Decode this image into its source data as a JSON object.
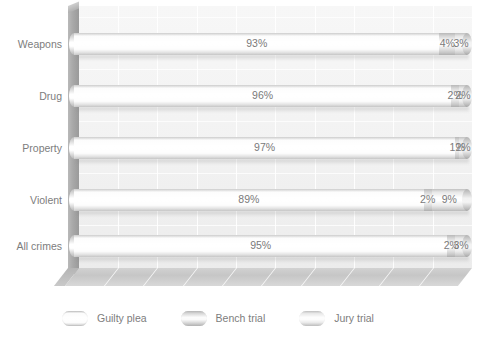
{
  "chart_data": {
    "type": "bar",
    "orientation": "horizontal",
    "stacked": true,
    "title": "",
    "subtitle": "",
    "xlabel": "",
    "ylabel": "",
    "xlim": [
      0,
      100
    ],
    "grid": true,
    "legend_position": "bottom",
    "categories": [
      "Weapons",
      "Drug",
      "Property",
      "Violent",
      "All crimes"
    ],
    "series": [
      {
        "name": "Guilty plea",
        "color": "#fcfcfc",
        "values": [
          93,
          96,
          97,
          89,
          95
        ],
        "labels": [
          "93%",
          "96%",
          "97%",
          "89%",
          "95%"
        ]
      },
      {
        "name": "Bench trial",
        "color": "#cfcfcf",
        "values": [
          4,
          2,
          1,
          2,
          2
        ],
        "labels": [
          "4%",
          "2%",
          "1%",
          "2%",
          "2%"
        ]
      },
      {
        "name": "Jury trial",
        "color": "#e3e3e3",
        "values": [
          3,
          2,
          2,
          9,
          3
        ],
        "labels": [
          "3%",
          "2%",
          "2%",
          "9%",
          "3%"
        ]
      }
    ]
  },
  "axis": {
    "category_labels": [
      "Weapons",
      "Drug",
      "Property",
      "Violent",
      "All crimes"
    ]
  },
  "legend": {
    "items": [
      {
        "label": "Guilty plea",
        "swatch": "guilty-plea-swatch"
      },
      {
        "label": "Bench trial",
        "swatch": "bench-trial-swatch"
      },
      {
        "label": "Jury trial",
        "swatch": "jury-trial-swatch"
      }
    ]
  },
  "colors": {
    "guilty_plea": "#fcfcfc",
    "bench_trial": "#cfcfcf",
    "jury_trial": "#e3e3e3",
    "plot_background": "#f2f2f2",
    "wall": "#a8a8a8",
    "floor": "#c6c6c6",
    "text": "#7d7d7d"
  }
}
